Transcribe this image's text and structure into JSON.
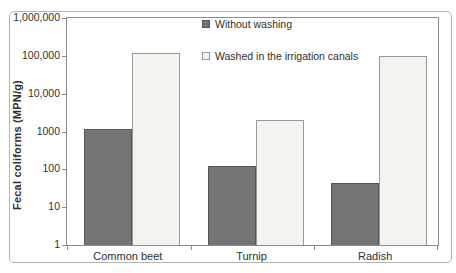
{
  "chart_data": {
    "type": "bar",
    "title": "",
    "xlabel": "",
    "ylabel": "Fecal coliforms (MPN/g)",
    "y_scale": "log",
    "ylim": [
      1,
      1000000
    ],
    "y_tick_labels": [
      "1,000,000",
      "100,000",
      "10,000",
      "1000",
      "100",
      "10",
      "1"
    ],
    "y_tick_values": [
      1000000,
      100000,
      10000,
      1000,
      100,
      10,
      1
    ],
    "categories": [
      "Common beet",
      "Turnip",
      "Radish"
    ],
    "series": [
      {
        "name": "Without washing",
        "values": [
          1200,
          120,
          45
        ],
        "fill": "#757575",
        "border": "#565656",
        "marker": "filled-square"
      },
      {
        "name": "Washed in the irrigation canals",
        "values": [
          120000,
          2000,
          100000
        ],
        "fill": "#f4f3f0",
        "border": "#9a9a9a",
        "marker": "open-square"
      }
    ],
    "grid": "off",
    "legend_position": "inside-top-center"
  },
  "colors": {
    "frame_border": "#b5b5b5",
    "plot_border": "#8c8c8c",
    "text": "#2f2f2f",
    "background": "#ffffff"
  }
}
